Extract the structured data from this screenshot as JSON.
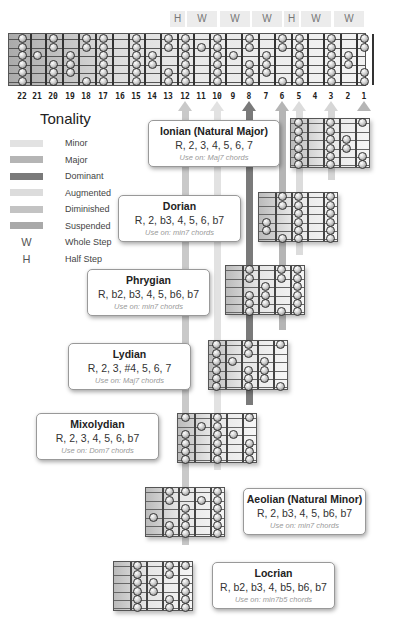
{
  "steps": [
    {
      "label": "H",
      "x": 170,
      "w": 15
    },
    {
      "label": "W",
      "x": 187,
      "w": 30
    },
    {
      "label": "W",
      "x": 220,
      "w": 30
    },
    {
      "label": "W",
      "x": 252,
      "w": 30
    },
    {
      "label": "H",
      "x": 284,
      "w": 15
    },
    {
      "label": "W",
      "x": 301,
      "w": 30
    },
    {
      "label": "W",
      "x": 334,
      "w": 30
    }
  ],
  "fretboard": {
    "fret_numbers": [
      "22",
      "21",
      "20",
      "19",
      "18",
      "17",
      "16",
      "15",
      "14",
      "13",
      "12",
      "11",
      "10",
      "9",
      "8",
      "7",
      "6",
      "5",
      "4",
      "3",
      "2",
      "1"
    ],
    "fret_x": [
      22,
      37,
      53,
      70,
      86,
      103,
      120,
      136,
      152,
      168,
      185,
      201,
      217,
      233,
      249,
      266,
      282,
      299,
      315,
      331,
      348,
      364
    ]
  },
  "legend": {
    "title": "Tonality",
    "items": [
      {
        "label": "Minor",
        "color": "#e2e2e2"
      },
      {
        "label": "Major",
        "color": "#b5b5b5"
      },
      {
        "label": "Dominant",
        "color": "#7a7a7a"
      },
      {
        "label": "Augmented",
        "color": "#dcdcdc"
      },
      {
        "label": "Diminished",
        "color": "#c3c3c3"
      },
      {
        "label": "Suspended",
        "color": "#a9a9a9"
      }
    ],
    "symbols": [
      {
        "symbol": "W",
        "label": "Whole Step"
      },
      {
        "symbol": "H",
        "label": "Half Step"
      }
    ]
  },
  "vertical_bars": [
    {
      "fret": "12",
      "x": 185,
      "color": "#c9c9c9",
      "bottom": 545
    },
    {
      "fret": "10",
      "x": 217,
      "color": "#e2e2e2",
      "bottom": 470
    },
    {
      "fret": "8",
      "x": 249,
      "color": "#7a7a7a",
      "bottom": 405
    },
    {
      "fret": "6",
      "x": 282,
      "color": "#b5b5b5",
      "bottom": 330
    },
    {
      "fret": "5",
      "x": 299,
      "color": "#dcdcdc",
      "bottom": 255
    },
    {
      "fret": "3",
      "x": 331,
      "color": "#d6d6d6",
      "bottom": 180
    },
    {
      "fret": "1",
      "x": 364,
      "color": "#b5b5b5",
      "bottom": 110
    }
  ],
  "modes": [
    {
      "name": "Ionian (Natural Major)",
      "formula": "R, 2, 3, 4, 5, 6, 7",
      "use": "Use on: Maj7 chords",
      "box": {
        "x": 148,
        "y": 120,
        "w": 132,
        "h": 47
      }
    },
    {
      "name": "Dorian",
      "formula": "R, 2, b3, 4, 5, 6, b7",
      "use": "Use on: min7 chords",
      "box": {
        "x": 118,
        "y": 195,
        "w": 123,
        "h": 47
      }
    },
    {
      "name": "Phrygian",
      "formula": "R, b2, b3, 4, 5, b6, b7",
      "use": "Use on: min7 chords",
      "box": {
        "x": 87,
        "y": 269,
        "w": 123,
        "h": 47
      }
    },
    {
      "name": "Lydian",
      "formula": "R, 2, 3, #4, 5, 6, 7",
      "use": "Use on: Maj7 chords",
      "box": {
        "x": 68,
        "y": 343,
        "w": 123,
        "h": 47
      }
    },
    {
      "name": "Mixolydian",
      "formula": "R, 2, 3, 4, 5, 6, b7",
      "use": "Use on: Dom7 chords",
      "box": {
        "x": 36,
        "y": 413,
        "w": 123,
        "h": 47
      }
    },
    {
      "name": "Aeolian (Natural Minor)",
      "formula": "R, 2, b3, 4, 5, b6, b7",
      "use": "Use on: min7 chords",
      "box": {
        "x": 243,
        "y": 488,
        "w": 123,
        "h": 47
      }
    },
    {
      "name": "Locrian",
      "formula": "R, b2, b3, 4, b5, b6, b7",
      "use": "Use on: min7b5 chords",
      "box": {
        "x": 212,
        "y": 562,
        "w": 123,
        "h": 47
      }
    }
  ]
}
